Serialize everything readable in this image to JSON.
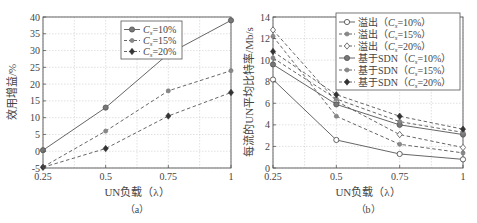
{
  "chart_data": [
    {
      "type": "line",
      "panel_label": "（a）",
      "title": "",
      "xlabel": "UN负载（λ）",
      "ylabel": "效用增益/%",
      "x": [
        0.25,
        0.5,
        0.75,
        1
      ],
      "xticks": [
        "0.25",
        "0.5",
        "0.75",
        "1"
      ],
      "yticks": [
        "-5",
        "0",
        "5",
        "10",
        "15",
        "20",
        "25",
        "30",
        "35",
        "40"
      ],
      "xlim": [
        0.25,
        1
      ],
      "ylim": [
        -5,
        40
      ],
      "grid": true,
      "legend_position": "upper center",
      "series": [
        {
          "name": "Cs=10%",
          "legend_label": "C",
          "legend_sub": "s",
          "legend_rest": "=10%",
          "style": "solid",
          "marker": "circle-filled",
          "values": [
            0.3,
            13,
            29,
            39
          ]
        },
        {
          "name": "Cs=15%",
          "legend_label": "C",
          "legend_sub": "s",
          "legend_rest": "=15%",
          "style": "dashed",
          "marker": "circle-small",
          "values": [
            -4.7,
            6,
            18,
            24
          ]
        },
        {
          "name": "Cs=20%",
          "legend_label": "C",
          "legend_sub": "s",
          "legend_rest": "=20%",
          "style": "dashed",
          "marker": "diamond-filled",
          "values": [
            -4.8,
            0.8,
            10.5,
            17.5
          ]
        }
      ]
    },
    {
      "type": "line",
      "panel_label": "（b）",
      "title": "",
      "xlabel": "UN负载（λ）",
      "ylabel": "每流的UN平均比特率/Mb/s",
      "x": [
        0.25,
        0.5,
        0.75,
        1
      ],
      "xticks": [
        "0.25",
        "0.5",
        "0.75",
        "1"
      ],
      "yticks": [
        "0",
        "2",
        "4",
        "6",
        "8",
        "10",
        "12",
        "14"
      ],
      "xlim": [
        0.25,
        1
      ],
      "ylim": [
        0,
        14
      ],
      "grid": true,
      "legend_position": "upper right",
      "series": [
        {
          "name": "溢出（Cs=10%）",
          "legend_prefix": "溢出（",
          "legend_label": "C",
          "legend_sub": "s",
          "legend_rest": "=10%）",
          "style": "solid",
          "marker": "circle-open",
          "values": [
            8.2,
            2.6,
            1.3,
            0.8
          ]
        },
        {
          "name": "溢出（Cs=15%）",
          "legend_prefix": "溢出（",
          "legend_label": "C",
          "legend_sub": "s",
          "legend_rest": "=15%）",
          "style": "dashed",
          "marker": "circle-small",
          "values": [
            12.2,
            4.8,
            2.2,
            1.4
          ]
        },
        {
          "name": "溢出（Cs=20%）",
          "legend_prefix": "溢出（",
          "legend_label": "C",
          "legend_sub": "s",
          "legend_rest": "=20%）",
          "style": "dashed",
          "marker": "diamond-open",
          "values": [
            12.8,
            6.2,
            3.1,
            1.9
          ]
        },
        {
          "name": "基于SDN（Cs=10%）",
          "legend_prefix": "基于SDN（",
          "legend_label": "C",
          "legend_sub": "s",
          "legend_rest": "=10%）",
          "style": "solid",
          "marker": "circle-filled",
          "values": [
            9.6,
            5.9,
            4.0,
            3.1
          ]
        },
        {
          "name": "基于SDN（Cs=15%）",
          "legend_prefix": "基于SDN（",
          "legend_label": "C",
          "legend_sub": "s",
          "legend_rest": "=15%）",
          "style": "dashed",
          "marker": "circle-small",
          "values": [
            10.2,
            6.4,
            4.3,
            3.3
          ]
        },
        {
          "name": "基于SDN（Cs=20%）",
          "legend_prefix": "基于SDN（",
          "legend_label": "C",
          "legend_sub": "s",
          "legend_rest": "=20%）",
          "style": "dashed",
          "marker": "diamond-filled",
          "values": [
            10.8,
            6.8,
            4.8,
            3.6
          ]
        }
      ]
    }
  ]
}
